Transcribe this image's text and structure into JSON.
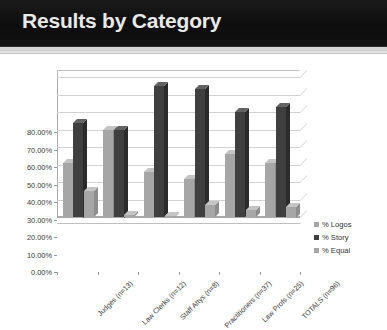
{
  "slide": {
    "title": "Results by Category"
  },
  "chart_data": {
    "type": "bar",
    "title": "",
    "xlabel": "",
    "ylabel": "",
    "ylim": [
      0,
      0.8
    ],
    "grid": true,
    "legend_position": "right",
    "y_tick_labels": [
      "80.00%",
      "70.00%",
      "60.00%",
      "50.00%",
      "40.00%",
      "30.00%",
      "20.00%",
      "10.00%",
      "0.00%"
    ],
    "y_ticks": [
      0.8,
      0.7,
      0.6,
      0.5,
      0.4,
      0.3,
      0.2,
      0.1,
      0.0
    ],
    "categories": [
      "Judges (n=13)",
      "Law Clerks (n=12)",
      "Staff Attys (n=8)",
      "Practitioners (n=37)",
      "Law Profs (n=25)",
      "TOTALS (n=96)"
    ],
    "series": [
      {
        "name": "% Logos",
        "color": "#a6a6a6",
        "values": [
          0.31,
          0.5,
          0.26,
          0.22,
          0.36,
          0.31
        ]
      },
      {
        "name": "% Story",
        "color": "#3f3f3f",
        "values": [
          0.54,
          0.5,
          0.75,
          0.73,
          0.6,
          0.63
        ]
      },
      {
        "name": "% Equal",
        "color": "#a6a6a6",
        "values": [
          0.15,
          0.01,
          0.005,
          0.07,
          0.04,
          0.06
        ]
      }
    ]
  }
}
